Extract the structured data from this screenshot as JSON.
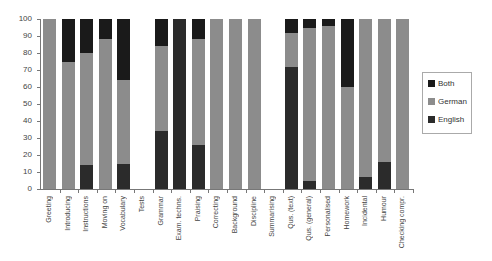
{
  "chart_data": {
    "type": "bar",
    "stacked": true,
    "title": "",
    "xlabel": "",
    "ylabel": "",
    "ylim": [
      0,
      100
    ],
    "yticks": [
      "0",
      "10",
      "20",
      "30",
      "40",
      "50",
      "60",
      "70",
      "80",
      "90",
      "100"
    ],
    "grid": false,
    "legend_position": "right",
    "categories": [
      "Greeting",
      "Introducing",
      "Instructions",
      "Moving on",
      "Vocabulary",
      "Tests",
      "Grammar",
      "Exam. techns.",
      "Praising",
      "Correcting",
      "Background",
      "Discipline",
      "Summarising",
      "Qus. (text)",
      "Qus. (general)",
      "Personalised",
      "Homework",
      "Incidental",
      "Humour",
      "Checking compr."
    ],
    "series": [
      {
        "name": "English",
        "color": "#2b2b2b",
        "values": [
          0,
          0,
          14,
          0,
          15,
          0,
          34,
          100,
          26,
          0,
          0,
          0,
          0,
          72,
          5,
          0,
          0,
          7,
          16,
          0
        ]
      },
      {
        "name": "German",
        "color": "#8c8c8c",
        "values": [
          100,
          75,
          66,
          88,
          49,
          0,
          50,
          0,
          62,
          100,
          100,
          100,
          0,
          20,
          90,
          96,
          60,
          93,
          84,
          100
        ]
      },
      {
        "name": "Both",
        "color": "#1a1a1a",
        "values": [
          0,
          25,
          20,
          12,
          36,
          0,
          16,
          0,
          12,
          0,
          0,
          0,
          0,
          8,
          5,
          4,
          40,
          0,
          0,
          0
        ]
      }
    ],
    "legend": [
      "Both",
      "German",
      "English"
    ]
  }
}
